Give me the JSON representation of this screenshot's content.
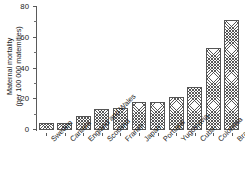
{
  "chart_data": {
    "type": "bar",
    "title": "",
    "subtitle": "",
    "xlabel": "",
    "ylabel": "Maternal mortality (per 100 000 maternities)",
    "ylabel_line1": "Maternal mortality",
    "ylabel_line2": "(per 100 000 maternities)",
    "ylim": [
      0,
      80
    ],
    "yticks": [
      0,
      20,
      40,
      60,
      80
    ],
    "ytick_labels": [
      "0",
      "20",
      "40",
      "60",
      "80"
    ],
    "yminor_ticks": [
      10,
      30,
      50,
      70
    ],
    "grid": false,
    "legend": null,
    "orientation": "vertical",
    "bar_fill": "diagonal-cross-hatch",
    "bar_edge_color": "#555555",
    "categories": [
      "Sweden",
      "Canada",
      "England and Wales",
      "Scotland",
      "France",
      "Japan",
      "Portugal",
      "Yugoslavia",
      "Cuba",
      "Colombia",
      "Brazil"
    ],
    "values": [
      4.5,
      4.5,
      9,
      13.5,
      14.5,
      18,
      18.5,
      21.5,
      28,
      53.5,
      71.5
    ],
    "units": "deaths per 100 000 maternities"
  },
  "colors": {
    "background": "#ffffff",
    "axis": "#5a5a5a",
    "text": "#1a1a1a",
    "bar_edge": "#555555",
    "hatch": "#464646"
  }
}
